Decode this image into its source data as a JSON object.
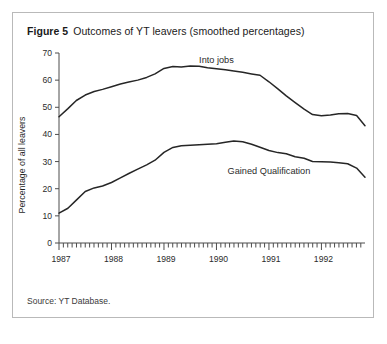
{
  "figure": {
    "label": "Figure 5",
    "title": "Outcomes of YT leavers (smoothed percentages)",
    "source": "Source: YT Database."
  },
  "chart_data": {
    "type": "line",
    "title": "Outcomes of YT leavers (smoothed percentages)",
    "xlabel": "",
    "ylabel": "Percentage of all leavers",
    "ylim": [
      0,
      70
    ],
    "yticks": [
      0,
      10,
      20,
      30,
      40,
      50,
      60,
      70
    ],
    "xlim": [
      1987.0,
      1992.83
    ],
    "xticks": [
      1987,
      1988,
      1989,
      1990,
      1991,
      1992
    ],
    "xtick_labels": [
      "1987",
      "1988",
      "1989",
      "1990",
      "1991",
      "1992"
    ],
    "grid": false,
    "legend": "inline-annotations",
    "minor_tick_interval_months": 1,
    "series": [
      {
        "name": "Into jobs",
        "annotation": "Into jobs",
        "annotation_x": 1990.0,
        "annotation_y": 66.5,
        "x": [
          1987.0,
          1987.17,
          1987.33,
          1987.5,
          1987.67,
          1987.83,
          1988.0,
          1988.17,
          1988.33,
          1988.5,
          1988.67,
          1988.83,
          1989.0,
          1989.17,
          1989.33,
          1989.5,
          1989.67,
          1989.83,
          1990.0,
          1990.17,
          1990.33,
          1990.5,
          1990.67,
          1990.83,
          1991.0,
          1991.17,
          1991.33,
          1991.5,
          1991.67,
          1991.83,
          1992.0,
          1992.17,
          1992.33,
          1992.5,
          1992.67,
          1992.83
        ],
        "values": [
          46.5,
          49.5,
          52.5,
          54.5,
          55.8,
          56.6,
          57.6,
          58.6,
          59.3,
          60.0,
          61.0,
          62.3,
          64.3,
          65.0,
          64.8,
          65.2,
          65.1,
          64.6,
          64.2,
          63.8,
          63.4,
          62.9,
          62.3,
          61.8,
          59.4,
          56.8,
          54.2,
          51.7,
          49.3,
          47.3,
          46.9,
          47.2,
          47.6,
          47.7,
          47.0,
          43.2
        ]
      },
      {
        "name": "Gained Qualification",
        "annotation": "Gained Qualification",
        "annotation_x": 1991.0,
        "annotation_y": 25.5,
        "x": [
          1987.0,
          1987.17,
          1987.33,
          1987.5,
          1987.67,
          1987.83,
          1988.0,
          1988.17,
          1988.33,
          1988.5,
          1988.67,
          1988.83,
          1989.0,
          1989.17,
          1989.33,
          1989.5,
          1989.67,
          1989.83,
          1990.0,
          1990.17,
          1990.33,
          1990.5,
          1990.67,
          1990.83,
          1991.0,
          1991.17,
          1991.33,
          1991.5,
          1991.67,
          1991.83,
          1992.0,
          1992.17,
          1992.33,
          1992.5,
          1992.67,
          1992.83
        ],
        "values": [
          11.0,
          12.8,
          15.8,
          19.0,
          20.3,
          21.0,
          22.3,
          24.0,
          25.6,
          27.2,
          28.8,
          30.5,
          33.4,
          35.2,
          35.8,
          36.0,
          36.2,
          36.4,
          36.6,
          37.1,
          37.6,
          37.3,
          36.4,
          35.3,
          34.1,
          33.3,
          32.9,
          31.8,
          31.2,
          30.0,
          29.9,
          29.8,
          29.6,
          29.2,
          27.6,
          24.2
        ]
      }
    ]
  }
}
